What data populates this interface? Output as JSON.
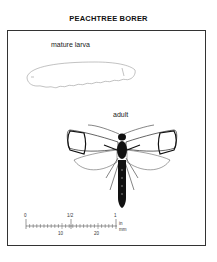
{
  "title": "PEACHTREE BORER",
  "labels": {
    "larva": "mature larva",
    "adult": "adult"
  },
  "scale": {
    "inch_ticks": [
      "0",
      "1/2",
      "1"
    ],
    "mm_ticks": [
      "10",
      "20"
    ],
    "unit_in": "in",
    "unit_mm": "mm"
  },
  "colors": {
    "ink": "#111111",
    "background": "#ffffff",
    "frame": "#333333"
  }
}
